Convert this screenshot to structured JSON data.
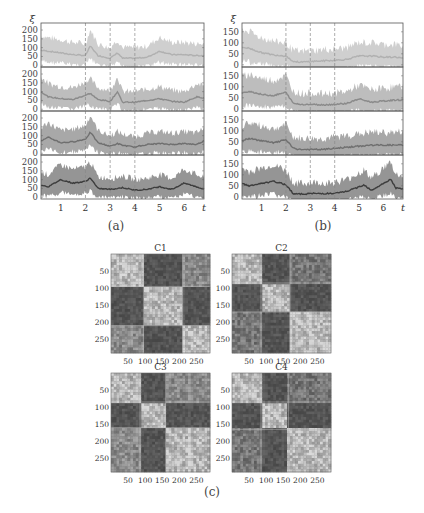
{
  "captions": {
    "a": "(a)",
    "b": "(b)",
    "c": "(c)"
  },
  "chart_data": [
    {
      "type": "line",
      "id": "a",
      "title": "(a)",
      "xlabel": "t",
      "ylabel": "ξ",
      "xticks": [
        1,
        2,
        3,
        4,
        5,
        6
      ],
      "xlim": [
        0.2,
        6.8
      ],
      "vlines": [
        2,
        3,
        4
      ],
      "subplots": [
        {
          "yticks": [
            0,
            50,
            100,
            150,
            200
          ],
          "ylim": [
            -10,
            240
          ],
          "color": "#b0b0b0",
          "band": "#cfcfcf",
          "x": [
            0.2,
            0.5,
            1,
            1.5,
            2,
            2.2,
            2.5,
            3,
            3.3,
            3.5,
            4,
            4.5,
            5,
            5.5,
            6,
            6.5,
            6.8
          ],
          "mean": [
            85,
            80,
            70,
            60,
            55,
            110,
            55,
            40,
            70,
            40,
            40,
            45,
            80,
            60,
            60,
            55,
            55
          ]
        },
        {
          "yticks": [
            0,
            50,
            100,
            150,
            200
          ],
          "ylim": [
            -10,
            240
          ],
          "color": "#8a8a8a",
          "band": "#bdbdbd",
          "x": [
            0.2,
            0.5,
            1,
            1.5,
            2,
            2.2,
            2.5,
            3,
            3.3,
            3.5,
            4,
            4.5,
            5,
            5.5,
            6,
            6.5,
            6.8
          ],
          "mean": [
            100,
            70,
            60,
            55,
            80,
            90,
            55,
            45,
            100,
            40,
            40,
            50,
            60,
            45,
            40,
            70,
            65
          ]
        },
        {
          "yticks": [
            0,
            50,
            100,
            150,
            200
          ],
          "ylim": [
            -10,
            240
          ],
          "color": "#6f6f6f",
          "band": "#a8a8a8",
          "x": [
            0.2,
            0.5,
            1,
            1.5,
            2,
            2.2,
            2.5,
            3,
            3.3,
            3.5,
            4,
            4.5,
            5,
            5.5,
            6,
            6.5,
            6.8
          ],
          "mean": [
            70,
            90,
            60,
            65,
            80,
            120,
            60,
            40,
            55,
            45,
            35,
            50,
            55,
            50,
            55,
            50,
            70
          ]
        },
        {
          "yticks": [
            0,
            50,
            100,
            150,
            200
          ],
          "ylim": [
            -10,
            240
          ],
          "color": "#3d3d3d",
          "band": "#959595",
          "x": [
            0.2,
            0.5,
            1,
            1.5,
            2,
            2.2,
            2.5,
            3,
            3.3,
            3.5,
            4,
            4.5,
            5,
            5.5,
            6,
            6.5,
            6.8
          ],
          "mean": [
            70,
            60,
            100,
            80,
            90,
            110,
            50,
            45,
            50,
            55,
            40,
            45,
            60,
            45,
            80,
            60,
            45
          ]
        }
      ]
    },
    {
      "type": "line",
      "id": "b",
      "title": "(b)",
      "xlabel": "t",
      "ylabel": "ξ",
      "xticks": [
        1,
        2,
        3,
        4,
        5,
        6
      ],
      "xlim": [
        0.2,
        6.8
      ],
      "vlines": [
        2,
        3,
        4
      ],
      "subplots": [
        {
          "yticks": [
            0,
            50,
            100,
            150
          ],
          "ylim": [
            -10,
            190
          ],
          "color": "#b0b0b0",
          "band": "#cfcfcf",
          "x": [
            0.2,
            0.5,
            1,
            1.5,
            2,
            2.3,
            2.6,
            3,
            3.5,
            4,
            4.5,
            5,
            5.5,
            6,
            6.5,
            6.8
          ],
          "mean": [
            80,
            75,
            55,
            45,
            40,
            15,
            12,
            15,
            18,
            20,
            25,
            40,
            40,
            35,
            35,
            30
          ]
        },
        {
          "yticks": [
            0,
            50,
            100,
            150
          ],
          "ylim": [
            -10,
            190
          ],
          "color": "#8a8a8a",
          "band": "#bdbdbd",
          "x": [
            0.2,
            0.5,
            1,
            1.5,
            2,
            2.3,
            2.6,
            3,
            3.5,
            4,
            4.5,
            5,
            5.5,
            6,
            6.5,
            6.8
          ],
          "mean": [
            70,
            80,
            65,
            60,
            75,
            25,
            20,
            20,
            18,
            20,
            25,
            45,
            30,
            35,
            40,
            40
          ]
        },
        {
          "yticks": [
            0,
            50,
            100,
            150
          ],
          "ylim": [
            -10,
            190
          ],
          "color": "#6f6f6f",
          "band": "#a8a8a8",
          "x": [
            0.2,
            0.5,
            1,
            1.5,
            2,
            2.3,
            2.6,
            3,
            3.5,
            4,
            4.5,
            5,
            5.5,
            6,
            6.5,
            6.8
          ],
          "mean": [
            55,
            65,
            55,
            45,
            60,
            20,
            15,
            15,
            15,
            20,
            25,
            30,
            35,
            35,
            35,
            35
          ]
        },
        {
          "yticks": [
            0,
            50,
            100,
            150
          ],
          "ylim": [
            -10,
            190
          ],
          "color": "#3d3d3d",
          "band": "#959595",
          "x": [
            0.2,
            0.5,
            1,
            1.5,
            2,
            2.3,
            2.6,
            3,
            3.5,
            4,
            4.5,
            5,
            5.2,
            5.5,
            6,
            6.3,
            6.5,
            6.8
          ],
          "mean": [
            60,
            50,
            60,
            70,
            55,
            15,
            12,
            15,
            15,
            15,
            25,
            45,
            55,
            30,
            60,
            80,
            40,
            35
          ]
        }
      ]
    },
    {
      "type": "heatmap",
      "id": "c",
      "title": "(c)",
      "panels": [
        {
          "label": "C1",
          "ticks": [
            50,
            100,
            150,
            200,
            250
          ],
          "size": 290,
          "blocks": [
            [
              0,
              95
            ],
            [
              95,
              210
            ],
            [
              210,
              290
            ]
          ]
        },
        {
          "label": "C2",
          "ticks": [
            50,
            100,
            150,
            200,
            250
          ],
          "size": 290,
          "blocks": [
            [
              0,
              85
            ],
            [
              85,
              170
            ],
            [
              170,
              290
            ]
          ]
        },
        {
          "label": "C3",
          "ticks": [
            50,
            100,
            150,
            200,
            250
          ],
          "size": 290,
          "blocks": [
            [
              0,
              85
            ],
            [
              85,
              160
            ],
            [
              160,
              290
            ]
          ]
        },
        {
          "label": "C4",
          "ticks": [
            50,
            100,
            150,
            200,
            250
          ],
          "size": 290,
          "blocks": [
            [
              0,
              85
            ],
            [
              85,
              165
            ],
            [
              165,
              290
            ]
          ]
        }
      ]
    }
  ]
}
